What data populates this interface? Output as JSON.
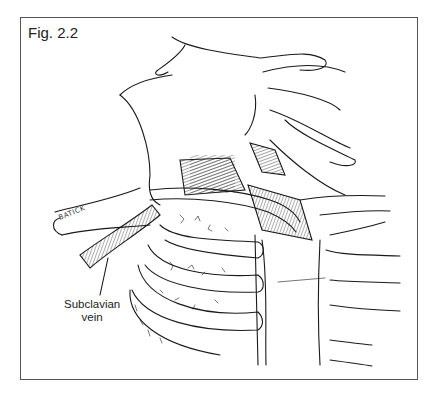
{
  "figure": {
    "label": "Fig. 2.2",
    "annotations": [
      {
        "text_line1": "Subclavian",
        "text_line2": "vein",
        "target": "subclavian-vein"
      }
    ],
    "artist_signature": "BATICK"
  },
  "colors": {
    "line": "#1a1a1a",
    "frame": "#555555",
    "background": "#ffffff"
  }
}
